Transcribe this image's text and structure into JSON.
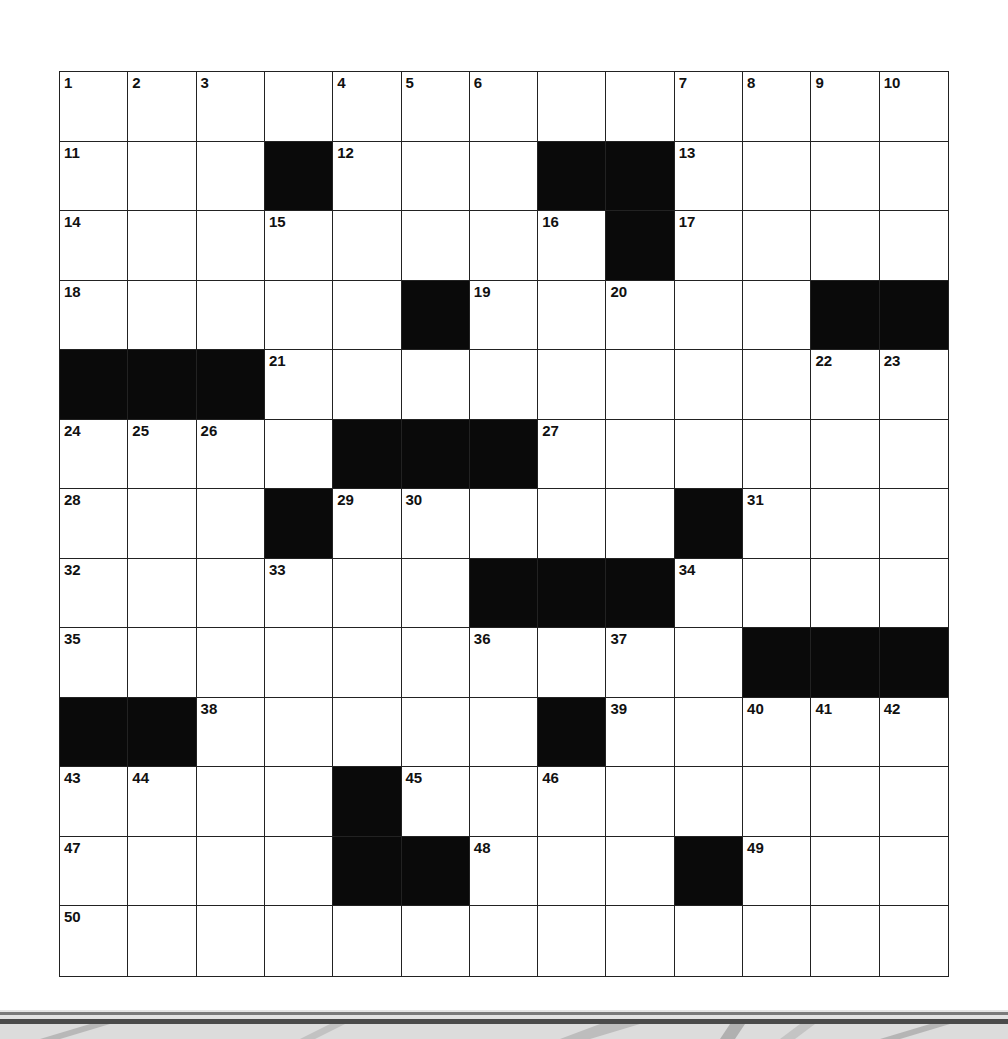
{
  "puzzle": {
    "rows": 13,
    "cols": 13,
    "grid": [
      [
        "1",
        "2",
        "3",
        "",
        "4",
        "5",
        "6",
        "",
        "",
        "7",
        "8",
        "9",
        "10"
      ],
      [
        "11",
        "",
        "",
        "#",
        "12",
        "",
        "",
        "#",
        "#",
        "13",
        "",
        "",
        ""
      ],
      [
        "14",
        "",
        "",
        "15",
        "",
        "",
        "",
        "16",
        "#",
        "17",
        "",
        "",
        ""
      ],
      [
        "18",
        "",
        "",
        "",
        "",
        "#",
        "19",
        "",
        "20",
        "",
        "",
        "#",
        "#"
      ],
      [
        "#",
        "#",
        "#",
        "21",
        "",
        "",
        "",
        "",
        "",
        "",
        "",
        "22",
        "23"
      ],
      [
        "24",
        "25",
        "26",
        "",
        "#",
        "#",
        "#",
        "27",
        "",
        "",
        "",
        "",
        ""
      ],
      [
        "28",
        "",
        "",
        "#",
        "29",
        "30",
        "",
        "",
        "",
        "#",
        "31",
        "",
        ""
      ],
      [
        "32",
        "",
        "",
        "33",
        "",
        "",
        "#",
        "#",
        "#",
        "34",
        "",
        "",
        ""
      ],
      [
        "35",
        "",
        "",
        "",
        "",
        "",
        "36",
        "",
        "37",
        "",
        "#",
        "#",
        "#"
      ],
      [
        "#",
        "#",
        "38",
        "",
        "",
        "",
        "",
        "#",
        "39",
        "",
        "40",
        "41",
        "42"
      ],
      [
        "43",
        "44",
        "",
        "",
        "#",
        "45",
        "",
        "46",
        "",
        "",
        "",
        "",
        ""
      ],
      [
        "47",
        "",
        "",
        "",
        "#",
        "#",
        "48",
        "",
        "",
        "#",
        "49",
        "",
        ""
      ],
      [
        "50",
        "",
        "",
        "",
        "",
        "",
        "",
        "",
        "",
        "",
        "",
        "",
        ""
      ]
    ]
  },
  "colors": {
    "block": "#0a0a0a",
    "line": "#222222",
    "cell": "#ffffff"
  }
}
